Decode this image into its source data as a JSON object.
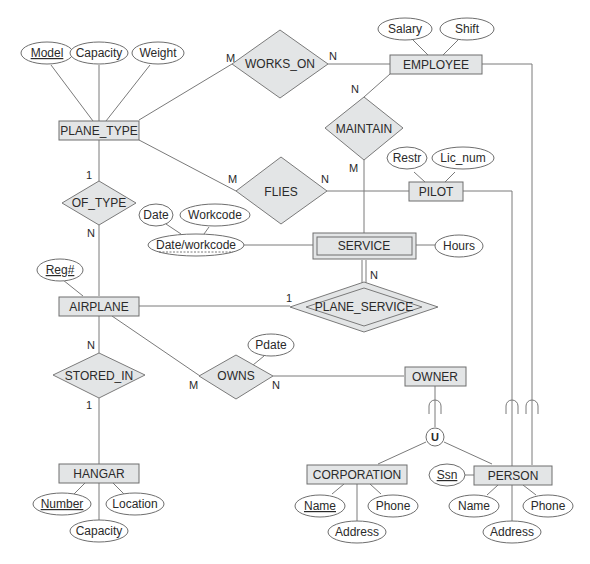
{
  "diagram": {
    "type": "EER diagram",
    "entities": {
      "plane_type": "PLANE_TYPE",
      "employee": "EMPLOYEE",
      "pilot": "PILOT",
      "service": "SERVICE",
      "airplane": "AIRPLANE",
      "owner": "OWNER",
      "hangar": "HANGAR",
      "corporation": "CORPORATION",
      "person": "PERSON"
    },
    "relationships": {
      "works_on": "WORKS_ON",
      "maintain": "MAINTAIN",
      "flies": "FLIES",
      "of_type": "OF_TYPE",
      "plane_service": "PLANE_SERVICE",
      "stored_in": "STORED_IN",
      "owns": "OWNS"
    },
    "attributes": {
      "model": "Model",
      "pt_capacity": "Capacity",
      "weight": "Weight",
      "salary": "Salary",
      "shift": "Shift",
      "restr": "Restr",
      "lic_num": "Lic_num",
      "date": "Date",
      "workcode": "Workcode",
      "date_workcode": "Date/workcode",
      "hours": "Hours",
      "reg": "Reg#",
      "pdate": "Pdate",
      "number": "Number",
      "location": "Location",
      "h_capacity": "Capacity",
      "corp_name": "Name",
      "corp_phone": "Phone",
      "corp_address": "Address",
      "ssn": "Ssn",
      "person_name": "Name",
      "person_phone": "Phone",
      "person_address": "Address"
    },
    "union_symbol": "U",
    "cardinalities": {
      "works_on_plane_type": "M",
      "works_on_employee": "N",
      "maintain_employee": "N",
      "maintain_service": "M",
      "flies_plane_type": "M",
      "flies_pilot": "N",
      "of_type_plane_type": "1",
      "of_type_airplane": "N",
      "plane_service_airplane": "1",
      "plane_service_service": "N",
      "stored_in_airplane": "N",
      "stored_in_hangar": "1",
      "owns_airplane": "M",
      "owns_owner": "N"
    }
  }
}
